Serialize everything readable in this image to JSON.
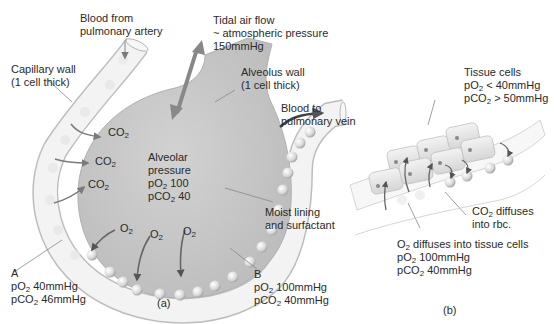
{
  "panel_a": {
    "caption": "(a)",
    "labels": {
      "blood_from_artery": [
        "Blood from",
        "pulmonary artery"
      ],
      "tidal_air": [
        "Tidal air flow",
        "~ atmospheric pressure",
        "150mmHg"
      ],
      "capillary_wall": [
        "Capillary wall",
        "(1 cell thick)"
      ],
      "alveolus_wall": [
        "Alveolus wall",
        "(1 cell thick)"
      ],
      "blood_to_vein": [
        "Blood to",
        "pulmonary vein"
      ],
      "alveolar_pressure": {
        "title": [
          "Alveolar",
          "pressure"
        ],
        "po2": "100",
        "pco2": "40"
      },
      "moist_lining": [
        "Moist lining",
        "and surfactant"
      ],
      "point_a": {
        "letter": "A",
        "po2": "40mmHg",
        "pco2": "46mmHg"
      },
      "point_b": {
        "letter": "B",
        "po2": "100mmHg",
        "pco2": "40mmHg"
      }
    },
    "gas_labels": {
      "co2": "CO",
      "o2": "O",
      "sub": "2"
    }
  },
  "panel_b": {
    "caption": "(b)",
    "tissue_cells": {
      "title": "Tissue cells",
      "po2": "< 40mmHg",
      "pco2": "> 50mmHg"
    },
    "co2_diffuses": [
      "diffuses",
      "into rbc."
    ],
    "o2_diffuses": {
      "text": "diffuses into tissue cells",
      "po2": "100mmHg",
      "pco2": "40mmHg"
    }
  },
  "colors": {
    "alveolus_fill": "#c9c9c9",
    "capillary_fill": "#f2f2f2",
    "arrow": "#7a7a7a",
    "rbc": "#e4e4e4",
    "text": "#2a2a2a"
  }
}
